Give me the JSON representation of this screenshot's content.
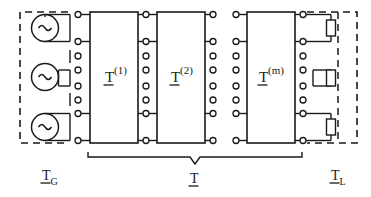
{
  "figure": {
    "type": "cascaded-multiport-network-schematic",
    "background_color": "#ffffff",
    "ink_color": "#1a1a1a"
  },
  "generator": {
    "name": "generator-section",
    "label_T": "T",
    "label_sub": "G",
    "border_style": "dashed",
    "sources": [
      {
        "name": "ac-source-1",
        "symbol": "~",
        "terminals": [
          1,
          2
        ]
      },
      {
        "name": "ac-source-2",
        "symbol": "~",
        "terminals": [
          4,
          5
        ]
      },
      {
        "name": "ac-source-3",
        "symbol": "~",
        "terminals": [
          7,
          8
        ]
      }
    ],
    "terminal_count": 8,
    "connected_terminals": [
      1,
      2,
      7,
      8
    ],
    "open_terminals": [
      3,
      4,
      5,
      6
    ]
  },
  "blocks": [
    {
      "name": "block-T1",
      "label_T": "T",
      "label_sup": "(1)"
    },
    {
      "name": "block-T2",
      "label_T": "T",
      "label_sup": "(2)"
    },
    {
      "name": "block-Tm",
      "label_T": "T",
      "label_sup": "(m)"
    }
  ],
  "cascade": {
    "name": "cascade-brace",
    "label_T": "T",
    "note": "overall chain matrix of cascaded blocks"
  },
  "load": {
    "name": "load-section",
    "label_T": "T",
    "label_sub": "L",
    "border_style": "dashed",
    "resistors": [
      {
        "name": "load-resistor-1",
        "terminals": [
          1,
          2
        ]
      },
      {
        "name": "load-resistor-2",
        "terminals": [
          4,
          5
        ]
      },
      {
        "name": "load-resistor-3",
        "terminals": [
          7,
          8
        ]
      }
    ],
    "terminal_count": 8
  },
  "terminal_columns": [
    {
      "name": "terminal-column-generator-out",
      "dots": 8,
      "wired": [
        1,
        2,
        7,
        8
      ]
    },
    {
      "name": "terminal-column-T1-in",
      "dots": 8,
      "wired": [
        1,
        2,
        7,
        8
      ]
    },
    {
      "name": "terminal-column-T1-out",
      "dots": 8,
      "wired": [
        1,
        2,
        7,
        8
      ]
    },
    {
      "name": "terminal-column-T2-in",
      "dots": 8,
      "wired": [
        1,
        2,
        7,
        8
      ]
    },
    {
      "name": "terminal-column-T2-out",
      "dots": 8,
      "wired": [
        1,
        2,
        7,
        8
      ]
    },
    {
      "name": "terminal-column-Tm-in",
      "dots": 8,
      "wired": [
        1,
        2,
        7,
        8
      ]
    },
    {
      "name": "terminal-column-Tm-out",
      "dots": 8,
      "wired": [
        1,
        2,
        7,
        8
      ]
    },
    {
      "name": "terminal-column-load-in",
      "dots": 8,
      "wired": [
        1,
        2,
        7,
        8
      ]
    }
  ]
}
